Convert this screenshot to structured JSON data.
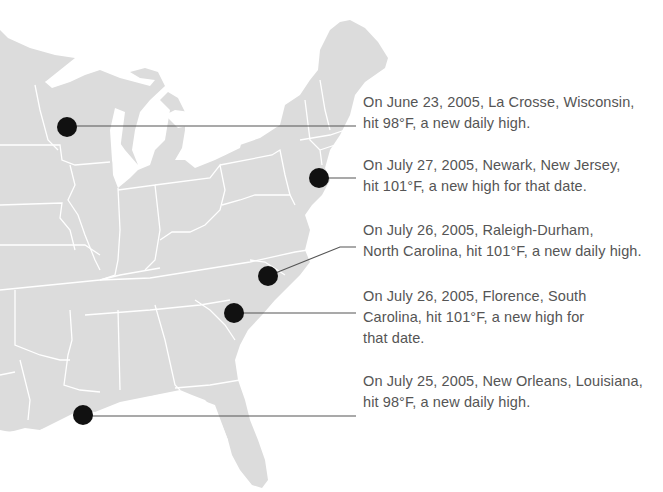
{
  "map": {
    "region": "Eastern United States",
    "land_color": "#dcdcdc",
    "border_color": "#ffffff",
    "marker_color": "#111111",
    "leader_color": "#555555",
    "text_color": "#555555"
  },
  "callouts": [
    {
      "city": "La Crosse, Wisconsin",
      "lines": [
        "On June 23, 2005, La Crosse, Wisconsin,",
        "hit 98°F, a new daily high."
      ],
      "marker": {
        "x": 67,
        "y": 127
      }
    },
    {
      "city": "Newark, New Jersey",
      "lines": [
        "On July 27, 2005, Newark, New Jersey,",
        "hit 101°F, a new high for that date."
      ],
      "marker": {
        "x": 319,
        "y": 178
      }
    },
    {
      "city": "Raleigh-Durham, North Carolina",
      "lines": [
        "On July 26, 2005, Raleigh-Durham,",
        "North Carolina, hit 101°F, a new daily high."
      ],
      "marker": {
        "x": 268,
        "y": 276
      }
    },
    {
      "city": "Florence, South Carolina",
      "lines": [
        "On July 26, 2005, Florence, South",
        "Carolina, hit 101°F, a new high for",
        "that date."
      ],
      "marker": {
        "x": 234,
        "y": 313
      }
    },
    {
      "city": "New Orleans, Louisiana",
      "lines": [
        "On July 25, 2005, New Orleans, Louisiana,",
        "hit 98°F, a new daily high."
      ],
      "marker": {
        "x": 83,
        "y": 415
      }
    }
  ]
}
